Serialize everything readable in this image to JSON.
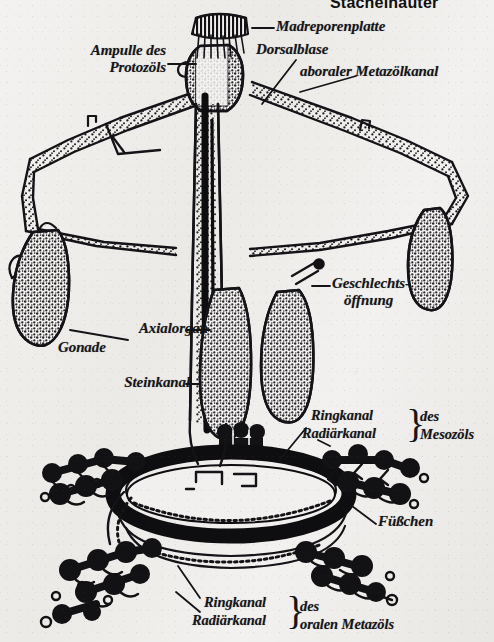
{
  "page": {
    "title": "Stachelhäuter",
    "title_note": "running head, cropped at top edge of page",
    "background_color": "#efeeec",
    "ink_color": "#141317",
    "figure_kind": "anatomical line drawing, German zoology textbook"
  },
  "labels": {
    "madreporenplatte": "Madreporenplatte",
    "dorsalblase": "Dorsalblase",
    "aboraler_metazoelkanal": "aboraler Metazölkanal",
    "ampulle_l1": "Ampulle des",
    "ampulle_l2": "Protozöls",
    "axialorgan": "Axialorgan",
    "gonade": "Gonade",
    "steinkanal": "Steinkanal",
    "geschlecht_l1": "Geschlechts-",
    "geschlecht_l2": "öffnung",
    "meso_ring": "Ringkanal",
    "meso_radial": "Radiärkanal",
    "meso_des": "des",
    "meso_coelom": "Mesozöls",
    "fuesschen": "Füßchen",
    "oral_ring": "Ringkanal",
    "oral_radial": "Radiärkanal",
    "oral_des": "des",
    "oral_coelom": "oralen Metazöls",
    "brace": "}"
  },
  "structures": [
    {
      "name": "madreporite-plate",
      "label": "Madreporenplatte",
      "note": "dark hatched cap at apex of dorsal sac"
    },
    {
      "name": "dorsal-sac",
      "label": "Dorsalblase",
      "note": "stippled bulb below madreporite"
    },
    {
      "name": "aboral-metacoel-canal",
      "label": "aboraler Metazölkanal",
      "note": "stippled canal ring spanning upper body"
    },
    {
      "name": "protocoel-ampulla",
      "label": "Ampulle des Protozöls",
      "note": "ampulla at left of dorsal sac"
    },
    {
      "name": "axial-organ",
      "label": "Axialorgan",
      "note": "vertical stippled column, centre"
    },
    {
      "name": "gonad",
      "label": "Gonade",
      "note": "teardrop stippled bodies, left and centre-right"
    },
    {
      "name": "stone-canal",
      "label": "Steinkanal",
      "note": "narrow dark vertical canal beside axial organ"
    },
    {
      "name": "genital-pore",
      "label": "Geschlechtsöffnung",
      "note": "small pore on right branch"
    },
    {
      "name": "mesocoel-ring-canal",
      "label": "Ringkanal des Mesozöls",
      "note": "upper thin ring of the oral ring complex"
    },
    {
      "name": "mesocoel-radial-canal",
      "label": "Radiärkanal des Mesozöls",
      "note": "radiating branch from upper ring"
    },
    {
      "name": "tube-feet",
      "label": "Füßchen",
      "note": "black bulbous ampullae with podia along radial canals"
    },
    {
      "name": "oral-metacoel-ring-canal",
      "label": "Ringkanal des oralen Metazöls",
      "note": "lower thin ring"
    },
    {
      "name": "oral-metacoel-radial-canal",
      "label": "Radiärkanal des oralen Metazöls",
      "note": "radiating branch from lower ring"
    },
    {
      "name": "ring-canal-bold",
      "label": "",
      "note": "heavy black torus — the main ring canal of the water vascular system"
    }
  ]
}
